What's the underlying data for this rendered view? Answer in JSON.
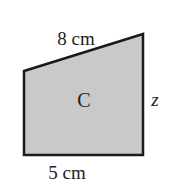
{
  "diagram": {
    "shape_name": "C",
    "top_label": "8 cm",
    "bottom_label": "5 cm",
    "right_label": "z",
    "fill_color": "#c9c9c9",
    "stroke_color": "#1a1a1a"
  }
}
